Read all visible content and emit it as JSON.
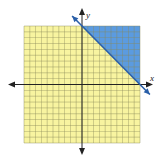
{
  "chart_data": {
    "type": "area",
    "title": "",
    "xlabel": "x",
    "ylabel": "y",
    "xlim": [
      -10,
      10
    ],
    "ylim": [
      -10,
      10
    ],
    "grid": true,
    "grid_step": 1,
    "boundary_line": {
      "equation": "x + y = 10",
      "points": [
        [
          0,
          10
        ],
        [
          10,
          0
        ]
      ],
      "style": "solid",
      "color": "#2a5fa8"
    },
    "shaded_region": {
      "inequality": "x + y >= 10",
      "vertices": [
        [
          0,
          10
        ],
        [
          10,
          10
        ],
        [
          10,
          0
        ]
      ],
      "color": "#5b9be0"
    },
    "unshaded_region_color": "#f8f4a0",
    "legend": []
  },
  "labels": {
    "x_axis": "x",
    "y_axis": "y"
  },
  "colors": {
    "grid": "#8a8a5a",
    "axis": "#222222",
    "background_grid": "#f8f4a0",
    "shade": "#5b9be0",
    "line": "#2a5fa8"
  }
}
